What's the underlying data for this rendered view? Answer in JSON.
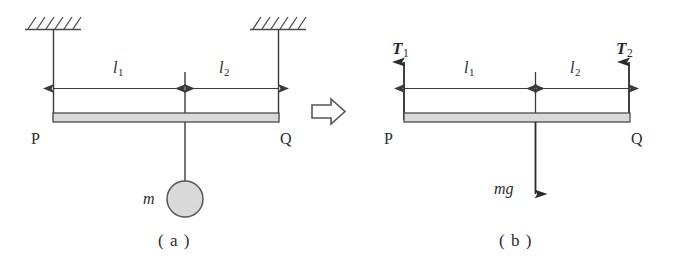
{
  "figure": {
    "type": "physics-free-body-diagram",
    "transform_arrow": "⇨"
  },
  "colors": {
    "line": "#3a3a3a",
    "beam_fill": "#d9d9d9",
    "beam_stroke": "#4a4a4a",
    "mass_fill": "#d9d9d9",
    "mass_stroke": "#555555",
    "hatch": "#4a4a4a",
    "text": "#2b2b2b",
    "background": "#ffffff"
  },
  "panel_a": {
    "caption": "( a )",
    "left_node": "P",
    "right_node": "Q",
    "length_left": "l",
    "length_left_sub": "1",
    "length_right": "l",
    "length_right_sub": "2",
    "mass_label": "m",
    "support_left": "hatched-ceiling-left",
    "support_right": "hatched-ceiling-right",
    "string_left": "vertical-string-left",
    "string_right": "vertical-string-right",
    "hanging_string": "vertical-string-mass"
  },
  "panel_b": {
    "caption": "( b )",
    "left_node": "P",
    "right_node": "Q",
    "length_left": "l",
    "length_left_sub": "1",
    "length_right": "l",
    "length_right_sub": "2",
    "tension_left": "T",
    "tension_left_sub": "1",
    "tension_right": "T",
    "tension_right_sub": "2",
    "weight_label": "mg"
  }
}
